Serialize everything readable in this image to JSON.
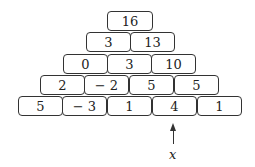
{
  "pyramid": {
    "rows": [
      [
        "16"
      ],
      [
        "3",
        "13"
      ],
      [
        "0",
        "3",
        "10"
      ],
      [
        "2",
        "− 2",
        "5",
        "5"
      ],
      [
        "5",
        "− 3",
        "1",
        "4",
        "1"
      ]
    ]
  },
  "annotation": {
    "label": "x",
    "points_to_row": 4,
    "points_to_col": 3
  }
}
